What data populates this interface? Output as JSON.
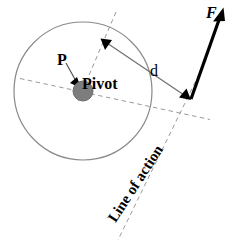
{
  "figure": {
    "width": 246,
    "height": 240,
    "background": "#ffffff",
    "stroke_light": "#808080",
    "stroke_dark": "#000000"
  },
  "labels": {
    "point_p": "P",
    "pivot": "Pivot",
    "distance": "d",
    "force": "F",
    "line_of_action": "Line of action"
  },
  "geometry": {
    "body_circle": {
      "cx": 83,
      "cy": 91,
      "r": 69,
      "stroke": "#8a8a8a",
      "fill": "none"
    },
    "pivot_dot": {
      "cx": 83,
      "cy": 91,
      "r": 10,
      "fill": "#7d7d7d",
      "stroke": "#6a6a6a"
    },
    "p_arrow": {
      "x1": 67,
      "y1": 64,
      "x2": 79,
      "y2": 86,
      "stroke": "#4a4a4a"
    },
    "force_vector": {
      "x1": 191,
      "y1": 99,
      "x2": 223,
      "y2": 9,
      "stroke": "#000000",
      "width": 3
    },
    "moment_arm": {
      "x1": 101,
      "y1": 38,
      "x2": 190,
      "y2": 99,
      "stroke": "#707070"
    },
    "line_of_action_dashed": {
      "x1": 203,
      "y1": 66,
      "x2": 121,
      "y2": 238,
      "stroke": "#9a9a9a"
    },
    "pivot_axis_dashed": {
      "x1": 22,
      "y1": 79,
      "x2": 208,
      "y2": 119,
      "stroke": "#9a9a9a"
    },
    "perpendicular_dashed": {
      "x1": 114,
      "y1": 14,
      "x2": 80,
      "y2": 94,
      "stroke": "#9a9a9a"
    }
  }
}
